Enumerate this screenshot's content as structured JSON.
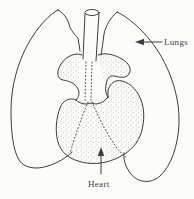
{
  "diagram": {
    "type": "anatomical-line-drawing",
    "background_color": "#fcfcfa",
    "ink_color": "#3d3d3d",
    "stipple_color": "#5c5c5c",
    "labels": {
      "lungs": {
        "text": "Lungs"
      },
      "heart": {
        "text": "Heart"
      }
    }
  }
}
